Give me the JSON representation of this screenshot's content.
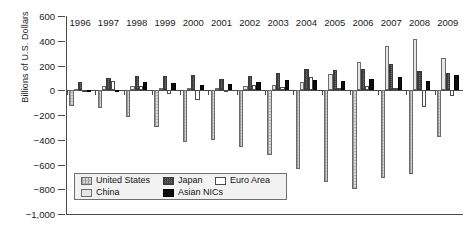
{
  "chart_data": {
    "type": "bar",
    "title": "",
    "xlabel": "",
    "ylabel": "Billions of U.S. Dollars",
    "ylim": [
      -1000,
      600
    ],
    "yticks": [
      600,
      400,
      200,
      0,
      -200,
      -400,
      -600,
      -800,
      -1000
    ],
    "ytick_labels": [
      "600",
      "400",
      "200",
      "0",
      "−200",
      "−400",
      "−600",
      "−800",
      "−1,000"
    ],
    "grid": false,
    "legend_position": "inside-lower-left",
    "categories": [
      "1996",
      "1997",
      "1998",
      "1999",
      "2000",
      "2001",
      "2002",
      "2003",
      "2004",
      "2005",
      "2006",
      "2007",
      "2008",
      "2009"
    ],
    "series": [
      {
        "name": "United States",
        "color": "#d8d8d8",
        "pattern": "cross-hatch-light",
        "values": [
          -125,
          -141,
          -215,
          -301,
          -417,
          -398,
          -459,
          -521,
          -634,
          -745,
          -800,
          -710,
          -677,
          -376
        ]
      },
      {
        "name": "China",
        "color": "#e6e6e6",
        "pattern": "solid-light",
        "values": [
          7,
          37,
          31,
          21,
          20,
          17,
          35,
          46,
          69,
          134,
          232,
          354,
          412,
          261
        ]
      },
      {
        "name": "Japan",
        "color": "#6e6e6e",
        "pattern": "cross-hatch-dark",
        "values": [
          66,
          97,
          119,
          115,
          120,
          88,
          112,
          136,
          172,
          166,
          171,
          212,
          157,
          142
        ]
      },
      {
        "name": "Euro Area",
        "color": "#ffffff",
        "pattern": "open",
        "values": [
          -8,
          73,
          31,
          -31,
          -80,
          -18,
          45,
          28,
          105,
          21,
          31,
          19,
          -139,
          -50
        ]
      },
      {
        "name": "Asian NICs",
        "color": "#0d0d0d",
        "pattern": "solid-black",
        "values": [
          -2,
          5,
          68,
          62,
          41,
          48,
          63,
          84,
          84,
          78,
          93,
          105,
          78,
          122
        ]
      }
    ],
    "legend": [
      {
        "label": "United States",
        "key": "United States"
      },
      {
        "label": "Japan",
        "key": "Japan"
      },
      {
        "label": "Euro Area",
        "key": "Euro Area"
      },
      {
        "label": "China",
        "key": "China"
      },
      {
        "label": "Asian NICs",
        "key": "Asian NICs"
      }
    ]
  }
}
